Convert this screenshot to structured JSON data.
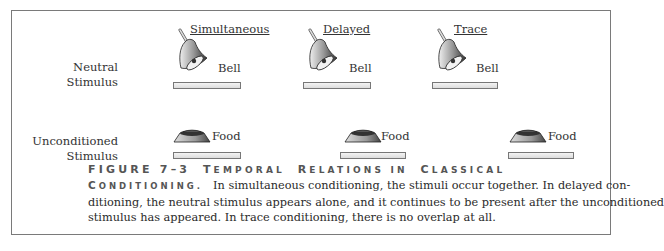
{
  "figure": {
    "columns": [
      {
        "label": "Simultaneous",
        "x": 190
      },
      {
        "label": "Delayed",
        "x": 322
      },
      {
        "label": "Trace",
        "x": 453
      }
    ],
    "rows": [
      {
        "label_line1": "Neutral",
        "label_line2": "Stimulus",
        "item_label": "Bell",
        "icon": "bell-icon"
      },
      {
        "label_line1": "Unconditioned",
        "label_line2": "Stimulus",
        "item_label": "Food",
        "icon": "food-bowl-icon"
      }
    ],
    "neutral_items": [
      {
        "column": "Simultaneous",
        "label": "Bell"
      },
      {
        "column": "Delayed",
        "label": "Bell"
      },
      {
        "column": "Trace",
        "label": "Bell"
      }
    ],
    "unconditioned_items": [
      {
        "column": "Simultaneous",
        "label": "Food"
      },
      {
        "column": "Delayed",
        "label": "Food"
      },
      {
        "column": "Trace",
        "label": "Food"
      }
    ]
  },
  "caption": {
    "figure_number": "FIGURE 7–3",
    "title_word1_cap": "T",
    "title_word1_rest": "EMPORAL",
    "title_word2_cap": "R",
    "title_word2_rest": "ELATIONS IN",
    "title_word3_cap": "C",
    "title_word3_rest": "LASSICAL",
    "title_word4_cap": "C",
    "title_word4_rest": "ONDITIONING.",
    "line1": "In simultaneous conditioning, the stimuli occur together. In delayed con-",
    "line2": "ditioning, the neutral stimulus appears alone, and it continues to be present after the unconditioned",
    "line3": "stimulus has appeared. In trace conditioning, there is no overlap at all."
  }
}
